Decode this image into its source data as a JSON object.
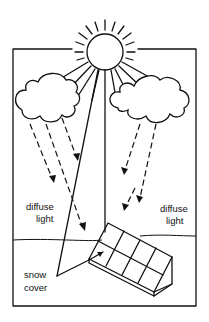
{
  "diagram": {
    "labels": {
      "diffuse_left": [
        "diffuse",
        "light"
      ],
      "diffuse_right": [
        "diffuse",
        "light"
      ],
      "snow": [
        "snow",
        "cover"
      ]
    },
    "elements": [
      "sun",
      "cloud-left",
      "cloud-right",
      "direct-beam",
      "diffuse-arrows",
      "horizon",
      "solar-panel",
      "snow-reflection"
    ],
    "colors": {
      "line": "#111111",
      "background": "#ffffff"
    }
  }
}
